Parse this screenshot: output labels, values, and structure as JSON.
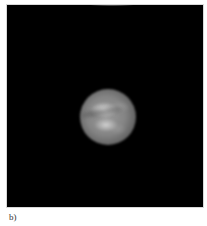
{
  "figure": {
    "panel_label": "b)",
    "background_color": "#000000"
  }
}
